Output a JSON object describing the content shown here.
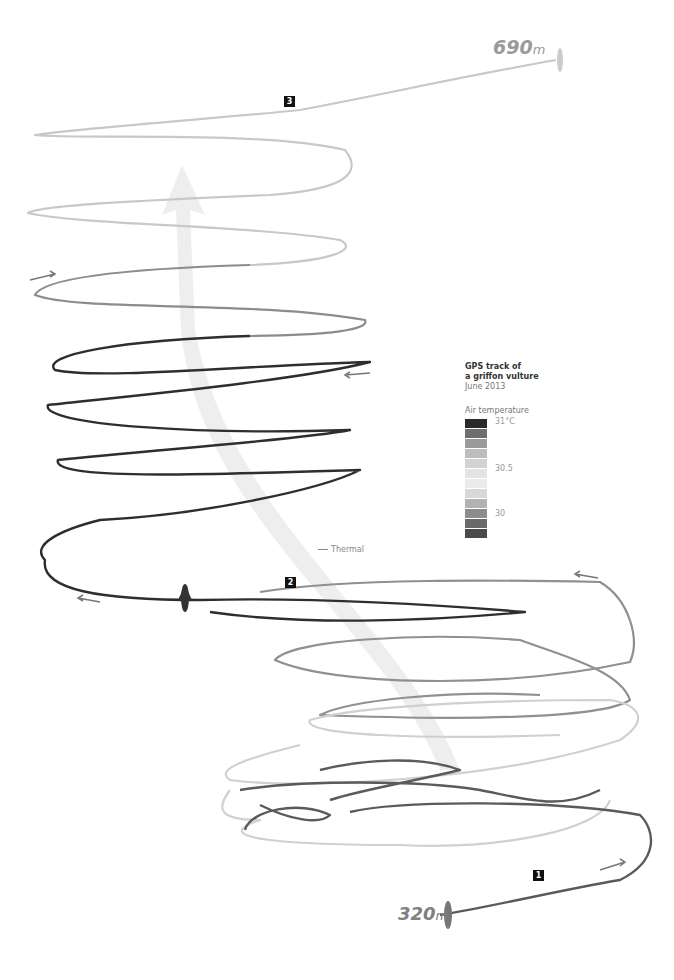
{
  "legend": {
    "title_line1": "GPS track of",
    "title_line2": "a griffon vulture",
    "date": "June 2013",
    "heading": "Air temperature",
    "ticks": {
      "top": "31°C",
      "mid": "30.5",
      "bottom": "30"
    },
    "swatches": [
      "#2a2a2a",
      "#6e6e6e",
      "#9a9a9a",
      "#bdbdbd",
      "#d2d2d2",
      "#e4e4e4",
      "#ebebeb",
      "#d8d8d8",
      "#b2b2b2",
      "#8c8c8c",
      "#6a6a6a",
      "#4a4a4a"
    ]
  },
  "altitude": {
    "top_value": "690",
    "bottom_value": "320",
    "unit": "m"
  },
  "markers": [
    "1",
    "2",
    "3"
  ],
  "thermal_label": "Thermal",
  "colors": {
    "warm": "#2a2a2a",
    "mid": "#8a8a8a",
    "cool": "#d0d0d0",
    "thermal": "#eeeeee"
  }
}
